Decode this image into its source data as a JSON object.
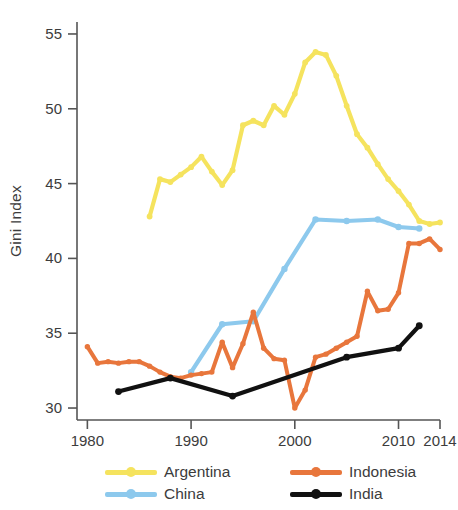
{
  "chart_data": {
    "type": "line",
    "title": "",
    "xlabel": "",
    "ylabel": "Gini Index",
    "xlim": [
      1979,
      2014
    ],
    "ylim": [
      29.2,
      55.8
    ],
    "xticks": [
      1980,
      1990,
      2000,
      2010,
      2014
    ],
    "xtick_labels": [
      "1980",
      "1990",
      "2000",
      "2010",
      "2014"
    ],
    "yticks": [
      30,
      35,
      40,
      45,
      50,
      55
    ],
    "ytick_labels": [
      "30",
      "35",
      "40",
      "45",
      "50",
      "55"
    ],
    "grid": false,
    "legend_position": "bottom",
    "markers": true,
    "series": [
      {
        "name": "Argentina",
        "color": "#F5E35E",
        "x": [
          1986,
          1987,
          1988,
          1989,
          1990,
          1991,
          1992,
          1993,
          1994,
          1995,
          1996,
          1997,
          1998,
          1999,
          2000,
          2001,
          2002,
          2003,
          2004,
          2005,
          2006,
          2007,
          2008,
          2009,
          2010,
          2011,
          2012,
          2013,
          2014
        ],
        "values": [
          42.8,
          45.3,
          45.1,
          45.6,
          46.1,
          46.8,
          45.8,
          44.9,
          45.9,
          48.9,
          49.2,
          48.9,
          50.2,
          49.6,
          51.0,
          53.1,
          53.8,
          53.6,
          52.2,
          50.2,
          48.3,
          47.4,
          46.3,
          45.3,
          44.5,
          43.6,
          42.5,
          42.3,
          42.4
        ]
      },
      {
        "name": "China",
        "color": "#8DC9ED",
        "x": [
          1990,
          1993,
          1996,
          1999,
          2002,
          2005,
          2008,
          2010,
          2012
        ],
        "values": [
          32.4,
          35.6,
          35.8,
          39.3,
          42.6,
          42.5,
          42.6,
          42.1,
          42.0
        ]
      },
      {
        "name": "Indonesia",
        "color": "#E8763C",
        "x": [
          1980,
          1981,
          1982,
          1983,
          1984,
          1985,
          1986,
          1987,
          1988,
          1989,
          1990,
          1991,
          1992,
          1993,
          1994,
          1995,
          1996,
          1997,
          1998,
          1999,
          2000,
          2001,
          2002,
          2003,
          2004,
          2005,
          2006,
          2007,
          2008,
          2009,
          2010,
          2011,
          2012,
          2013,
          2014
        ],
        "values": [
          34.1,
          33.0,
          33.1,
          33.0,
          33.1,
          33.1,
          32.8,
          32.4,
          32.1,
          32.0,
          32.2,
          32.3,
          32.4,
          34.4,
          32.7,
          34.3,
          36.4,
          34.0,
          33.3,
          33.2,
          30.0,
          31.2,
          33.4,
          33.6,
          34.0,
          34.4,
          34.8,
          37.8,
          36.5,
          36.6,
          37.7,
          41.0,
          41.0,
          41.3,
          40.6
        ]
      },
      {
        "name": "India",
        "color": "#111111",
        "x": [
          1983,
          1988,
          1994,
          2005,
          2010,
          2012
        ],
        "values": [
          31.1,
          32.0,
          30.8,
          33.4,
          34.0,
          35.5
        ]
      }
    ]
  },
  "axis": {
    "y_title": "Gini Index"
  },
  "legend": {
    "items": [
      {
        "label": "Argentina",
        "color": "#F5E35E"
      },
      {
        "label": "China",
        "color": "#8DC9ED"
      },
      {
        "label": "Indonesia",
        "color": "#E8763C"
      },
      {
        "label": "India",
        "color": "#111111"
      }
    ]
  },
  "colors": {
    "argentina": "#F5E35E",
    "china": "#8DC9ED",
    "indonesia": "#E8763C",
    "india": "#111111",
    "axis": "#555555",
    "text": "#3c3c3c",
    "background": "#ffffff"
  }
}
